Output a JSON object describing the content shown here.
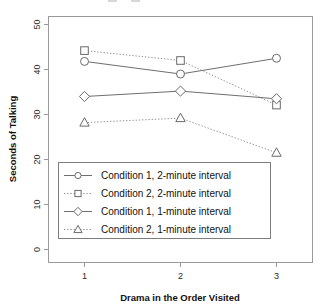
{
  "chart_data": {
    "type": "line",
    "title": "",
    "xlabel": "Drama in the Order Visited",
    "ylabel": "Seconds of Talking",
    "x": [
      1,
      2,
      3
    ],
    "xticklabels": [
      "1",
      "2",
      "3"
    ],
    "yticklabels": [
      "0",
      "10",
      "20",
      "30",
      "40",
      "50"
    ],
    "yticks": [
      0,
      10,
      20,
      30,
      40,
      50
    ],
    "ylim": [
      0,
      52
    ],
    "xlim": [
      0.6,
      3.4
    ],
    "grid": false,
    "legend_position": "lower-left-inside",
    "series": [
      {
        "name": "Condition 1, 2-minute interval",
        "marker": "circle",
        "linestyle": "solid",
        "values": [
          41.8,
          39.0,
          42.5
        ]
      },
      {
        "name": "Condition 2, 2-minute interval",
        "marker": "square",
        "linestyle": "dotted",
        "values": [
          44.2,
          42.0,
          32.1
        ]
      },
      {
        "name": "Condition 1, 1-minute interval",
        "marker": "diamond",
        "linestyle": "solid",
        "values": [
          34.0,
          35.2,
          33.5
        ]
      },
      {
        "name": "Condition 2, 1-minute interval",
        "marker": "triangle",
        "linestyle": "dotted",
        "values": [
          28.2,
          29.2,
          21.5
        ]
      }
    ]
  },
  "axes": {
    "y_title": "Seconds of Talking",
    "x_title": "Drama in the Order Visited",
    "y_tick_0": "0",
    "y_tick_1": "10",
    "y_tick_2": "20",
    "y_tick_3": "30",
    "y_tick_4": "40",
    "y_tick_5": "50",
    "x_tick_0": "1",
    "x_tick_1": "2",
    "x_tick_2": "3"
  },
  "legend": {
    "entries": [
      {
        "label": "Condition 1, 2-minute interval"
      },
      {
        "label": "Condition 2, 2-minute interval"
      },
      {
        "label": "Condition 1, 1-minute interval"
      },
      {
        "label": "Condition 2, 1-minute interval"
      }
    ]
  },
  "colors": {
    "line": "#6e6e6e",
    "frame": "#9a9a9a",
    "text": "#111111",
    "background": "#ffffff"
  }
}
